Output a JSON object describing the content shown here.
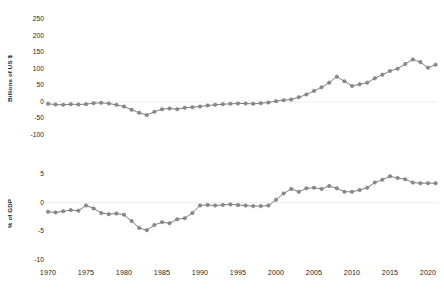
{
  "chart_data": [
    {
      "type": "line",
      "panel": "top",
      "title": "",
      "xlabel": "",
      "ylabel": "Billions of US $",
      "xlim": [
        1970,
        2021
      ],
      "ylim": [
        -100,
        250
      ],
      "yticks": [
        250,
        200,
        150,
        100,
        50,
        0,
        -50,
        -100
      ],
      "xticks": [
        1970,
        1975,
        1980,
        1985,
        1990,
        1995,
        2000,
        2005,
        2010,
        2015,
        2020
      ],
      "grid": false,
      "legend": "none",
      "marker": "circle",
      "color": "#808080",
      "x": [
        1970,
        1971,
        1972,
        1973,
        1974,
        1975,
        1976,
        1977,
        1978,
        1979,
        1980,
        1981,
        1982,
        1983,
        1984,
        1985,
        1986,
        1987,
        1988,
        1989,
        1990,
        1991,
        1992,
        1993,
        1994,
        1995,
        1996,
        1997,
        1998,
        1999,
        2000,
        2001,
        2002,
        2003,
        2004,
        2005,
        2006,
        2007,
        2008,
        2009,
        2010,
        2011,
        2012,
        2013,
        2014,
        2015,
        2016,
        2017,
        2018,
        2019,
        2020,
        2021
      ],
      "values": [
        -6,
        -8,
        -9,
        -7,
        -8,
        -7,
        -4,
        -3,
        -5,
        -9,
        -14,
        -24,
        -33,
        -40,
        -30,
        -22,
        -20,
        -22,
        -18,
        -16,
        -14,
        -11,
        -9,
        -7,
        -6,
        -5,
        -5,
        -6,
        -4,
        -2,
        2,
        5,
        7,
        14,
        22,
        33,
        44,
        58,
        76,
        62,
        48,
        53,
        58,
        71,
        82,
        93,
        100,
        114,
        128,
        120,
        103,
        112
      ],
      "ylabel_unit": "Billions of US $"
    },
    {
      "type": "line",
      "panel": "bottom",
      "title": "",
      "xlabel": "",
      "ylabel": "% of GDP",
      "xlim": [
        1970,
        2021
      ],
      "ylim": [
        -10,
        7
      ],
      "yticks": [
        5,
        0,
        -5,
        -10
      ],
      "xticks": [
        1970,
        1975,
        1980,
        1985,
        1990,
        1995,
        2000,
        2005,
        2010,
        2015,
        2020
      ],
      "grid": false,
      "legend": "none",
      "marker": "circle",
      "color": "#808080",
      "x": [
        1970,
        1971,
        1972,
        1973,
        1974,
        1975,
        1976,
        1977,
        1978,
        1979,
        1980,
        1981,
        1982,
        1983,
        1984,
        1985,
        1986,
        1987,
        1988,
        1989,
        1990,
        1991,
        1992,
        1993,
        1994,
        1995,
        1996,
        1997,
        1998,
        1999,
        2000,
        2001,
        2002,
        2003,
        2004,
        2005,
        2006,
        2007,
        2008,
        2009,
        2010,
        2011,
        2012,
        2013,
        2014,
        2015,
        2016,
        2017,
        2018,
        2019,
        2020,
        2021
      ],
      "values": [
        -1.6,
        -1.7,
        -1.5,
        -1.3,
        -1.4,
        -0.5,
        -1.0,
        -1.8,
        -2.0,
        -1.9,
        -2.1,
        -3.2,
        -4.4,
        -4.8,
        -3.9,
        -3.4,
        -3.6,
        -2.9,
        -2.7,
        -1.8,
        -0.5,
        -0.4,
        -0.5,
        -0.4,
        -0.3,
        -0.4,
        -0.5,
        -0.6,
        -0.6,
        -0.5,
        0.5,
        1.6,
        2.4,
        1.9,
        2.5,
        2.6,
        2.4,
        2.9,
        2.5,
        1.9,
        1.9,
        2.2,
        2.6,
        3.5,
        4.0,
        4.6,
        4.3,
        4.1,
        3.5,
        3.4,
        3.4,
        3.4
      ],
      "ylabel_unit": "% of GDP"
    }
  ],
  "top_chart": {
    "axis_title": "Billions of US $",
    "ytick_labels": [
      "250",
      "200",
      "150",
      "100",
      "50",
      "0",
      "-50",
      "-100"
    ]
  },
  "bottom_chart": {
    "axis_title": "% of GDP",
    "ytick_labels": [
      "5",
      "0",
      "-5",
      "-10"
    ]
  },
  "x_axis": {
    "tick_labels": [
      "1970",
      "1975",
      "1980",
      "1985",
      "1990",
      "1995",
      "2000",
      "2005",
      "2010",
      "2015",
      "2020"
    ]
  }
}
